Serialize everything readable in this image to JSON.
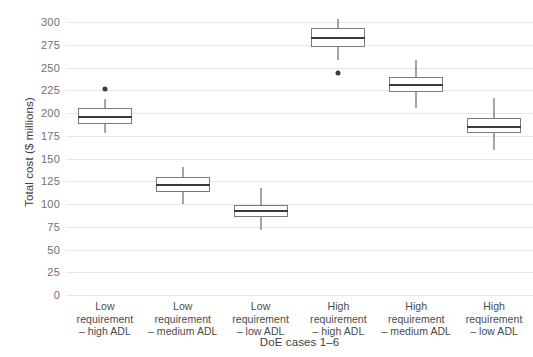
{
  "chart_data": {
    "type": "box",
    "title": "",
    "xlabel": "DoE cases 1–6",
    "ylabel": "Total cost ($ millions)",
    "ylim": [
      0,
      300
    ],
    "ytick_values": [
      0,
      25,
      50,
      75,
      100,
      125,
      150,
      175,
      200,
      225,
      250,
      275,
      300
    ],
    "ytick_labels": [
      "0",
      "25",
      "50",
      "75",
      "100",
      "125",
      "150",
      "175",
      "200",
      "225",
      "250",
      "275",
      "300"
    ],
    "grid": true,
    "legend": "none",
    "categories": [
      "Low\nrequirement\n– high ADL",
      "Low\nrequirement\n– medium ADL",
      "Low\nrequirement\n– low ADL",
      "High\nrequirement\n– high ADL",
      "High\nrequirement\n– medium ADL",
      "High\nrequirement\n– low ADL"
    ],
    "boxes": [
      {
        "name": "Low requirement – high ADL",
        "whisker_low": 178,
        "q1": 188,
        "median": 196,
        "q3": 205,
        "whisker_high": 215,
        "outliers": [
          226
        ]
      },
      {
        "name": "Low requirement – medium ADL",
        "whisker_low": 100,
        "q1": 113,
        "median": 121,
        "q3": 130,
        "whisker_high": 141,
        "outliers": []
      },
      {
        "name": "Low requirement – low ADL",
        "whisker_low": 71,
        "q1": 86,
        "median": 92,
        "q3": 99,
        "whisker_high": 118,
        "outliers": []
      },
      {
        "name": "High requirement – high ADL",
        "whisker_low": 258,
        "q1": 272,
        "median": 282,
        "q3": 293,
        "whisker_high": 303,
        "outliers": [
          244
        ]
      },
      {
        "name": "High requirement – medium ADL",
        "whisker_low": 206,
        "q1": 223,
        "median": 231,
        "q3": 240,
        "whisker_high": 258,
        "outliers": []
      },
      {
        "name": "High requirement – low ADL",
        "whisker_low": 159,
        "q1": 178,
        "median": 185,
        "q3": 194,
        "whisker_high": 216,
        "outliers": []
      }
    ],
    "colors": {
      "box_stroke": "#7a7a7a",
      "box_fill": "#ffffff",
      "median": "#3a3a3a",
      "whisker": "#4d4d4d",
      "outlier": "#3a3a3a",
      "grid": "#e8e8e8",
      "tick_text": "#6f6f6f",
      "axis_title": "#3d3d3d",
      "background": "#ffffff"
    }
  }
}
